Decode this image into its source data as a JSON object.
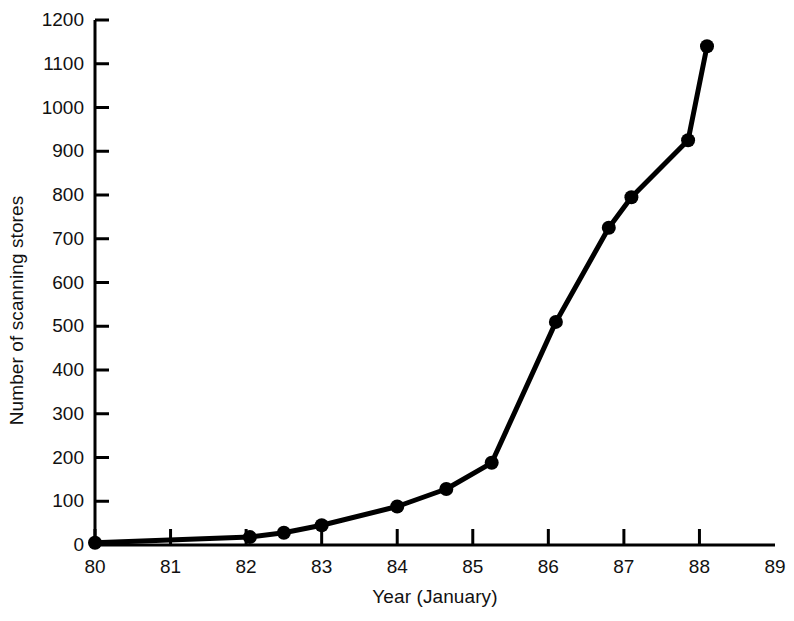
{
  "chart_data": {
    "type": "line",
    "title": "",
    "xlabel": "Year (January)",
    "ylabel": "Number of scanning stores",
    "xlim": [
      80,
      89
    ],
    "ylim": [
      0,
      1200
    ],
    "xticks": [
      80,
      81,
      82,
      83,
      84,
      85,
      86,
      87,
      88,
      89
    ],
    "xtick_labels": [
      "80",
      "81",
      "82",
      "83",
      "84",
      "85",
      "86",
      "87",
      "88",
      "89"
    ],
    "yticks": [
      0,
      100,
      200,
      300,
      400,
      500,
      600,
      700,
      800,
      900,
      1000,
      1100,
      1200
    ],
    "ytick_labels": [
      "0",
      "100",
      "200",
      "300",
      "400",
      "500",
      "600",
      "700",
      "800",
      "900",
      "1000",
      "1100",
      "1200"
    ],
    "grid": false,
    "legend": null,
    "marker": "filled-circle",
    "line_color": "#000000",
    "marker_color": "#000000",
    "background_color": "#ffffff",
    "x": [
      80.0,
      82.05,
      82.5,
      83.0,
      84.0,
      84.65,
      85.25,
      86.1,
      86.8,
      87.1,
      87.85,
      88.1
    ],
    "values": [
      5,
      18,
      28,
      45,
      88,
      128,
      188,
      510,
      725,
      795,
      925,
      1140
    ],
    "points": [
      {
        "x": 80.0,
        "y": 5
      },
      {
        "x": 82.05,
        "y": 18
      },
      {
        "x": 82.5,
        "y": 28
      },
      {
        "x": 83.0,
        "y": 45
      },
      {
        "x": 84.0,
        "y": 88
      },
      {
        "x": 84.65,
        "y": 128
      },
      {
        "x": 85.25,
        "y": 188
      },
      {
        "x": 86.1,
        "y": 510
      },
      {
        "x": 86.8,
        "y": 725
      },
      {
        "x": 87.1,
        "y": 795
      },
      {
        "x": 87.85,
        "y": 925
      },
      {
        "x": 88.1,
        "y": 1140
      }
    ]
  }
}
